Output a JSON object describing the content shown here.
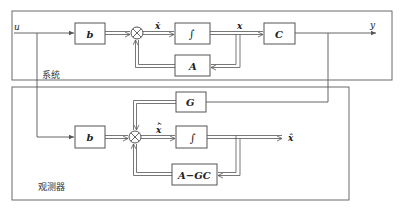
{
  "diagram": {
    "type": "block-diagram",
    "groups": {
      "system": {
        "label": "系统"
      },
      "observer": {
        "label": "观测器"
      }
    },
    "signals": {
      "input": "u",
      "output": "y",
      "state": "x",
      "state_derivative": "ẋ",
      "estimate": "x̂",
      "estimate_derivative": "x̂̇"
    },
    "blocks": {
      "system_b": "b",
      "system_integrator": "∫",
      "system_A": "A",
      "system_C": "C",
      "observer_G": "G",
      "observer_b": "b",
      "observer_integrator": "∫",
      "observer_AGC": "A−GC"
    },
    "edges": [
      {
        "from": "u",
        "to": "system_b"
      },
      {
        "from": "system_b",
        "to": "system_sum"
      },
      {
        "from": "system_sum",
        "to": "system_integrator",
        "label": "ẋ"
      },
      {
        "from": "system_integrator",
        "to": "system_C",
        "label": "x"
      },
      {
        "from": "system_integrator",
        "to": "system_A"
      },
      {
        "from": "system_A",
        "to": "system_sum"
      },
      {
        "from": "system_C",
        "to": "y"
      },
      {
        "from": "u",
        "to": "observer_b"
      },
      {
        "from": "y",
        "to": "observer_G"
      },
      {
        "from": "observer_G",
        "to": "observer_sum"
      },
      {
        "from": "observer_b",
        "to": "observer_sum"
      },
      {
        "from": "observer_sum",
        "to": "observer_integrator",
        "label": "x̂̇"
      },
      {
        "from": "observer_integrator",
        "to": "x̂"
      },
      {
        "from": "observer_integrator",
        "to": "observer_AGC"
      },
      {
        "from": "observer_AGC",
        "to": "observer_sum"
      }
    ]
  }
}
